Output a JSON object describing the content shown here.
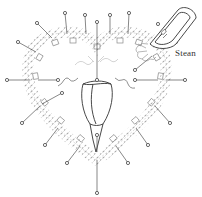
{
  "figure": {
    "labels": {
      "steam": "Stean"
    },
    "colors": {
      "line": "#555555",
      "lace": "#9a9a9a",
      "background": "#ffffff"
    },
    "pins": [
      [
        65,
        13
      ],
      [
        85,
        15
      ],
      [
        97,
        22
      ],
      [
        110,
        15
      ],
      [
        129,
        13
      ],
      [
        37,
        23
      ],
      [
        18,
        42
      ],
      [
        7,
        80
      ],
      [
        58,
        80
      ],
      [
        62,
        93
      ],
      [
        22,
        123
      ],
      [
        45,
        145
      ],
      [
        67,
        163
      ],
      [
        97,
        193
      ],
      [
        135,
        80
      ],
      [
        185,
        80
      ],
      [
        170,
        123
      ],
      [
        148,
        145
      ],
      [
        128,
        163
      ],
      [
        135,
        42
      ]
    ]
  }
}
